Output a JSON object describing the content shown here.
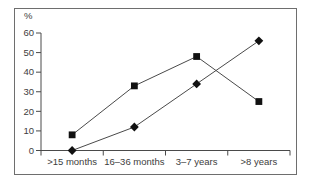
{
  "figure": {
    "background": "#ffffff",
    "frame_border_color": "#6e6e6e"
  },
  "chart_data": {
    "type": "line",
    "title": "",
    "xlabel": "",
    "ylabel": "%",
    "categories": [
      ">15 months",
      "16–36 months",
      "3–7 years",
      ">8 years"
    ],
    "series": [
      {
        "name": "square-series",
        "marker": "square",
        "values": [
          8,
          33,
          48,
          25
        ]
      },
      {
        "name": "diamond-series",
        "marker": "diamond",
        "values": [
          0,
          12,
          34,
          56
        ]
      }
    ],
    "ylim": [
      0,
      60
    ],
    "yticks": [
      0,
      10,
      20,
      30,
      40,
      50,
      60
    ],
    "grid": false,
    "legend": "none",
    "line_color": "#4a4a4a",
    "marker_color": "#111111",
    "axis_color": "#4a4a4a",
    "text_color": "#3d3d3d"
  }
}
